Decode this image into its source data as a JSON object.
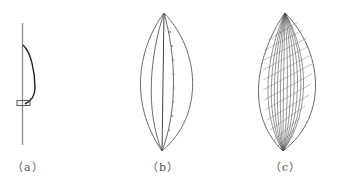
{
  "figure": {
    "panels": [
      {
        "id": "a",
        "label": "（a）",
        "description": "Single midrib with one bent rib curve and a rectangular node"
      },
      {
        "id": "b",
        "label": "（b）",
        "description": "Leaf outline with midrib and parallel veins; one vein dotted"
      },
      {
        "id": "c",
        "label": "（c）",
        "description": "Leaf outline densely filled with many curved hatched veins"
      }
    ],
    "colors": {
      "stroke": "#777777",
      "stroke_dark": "#222222",
      "background": "#ffffff"
    }
  }
}
